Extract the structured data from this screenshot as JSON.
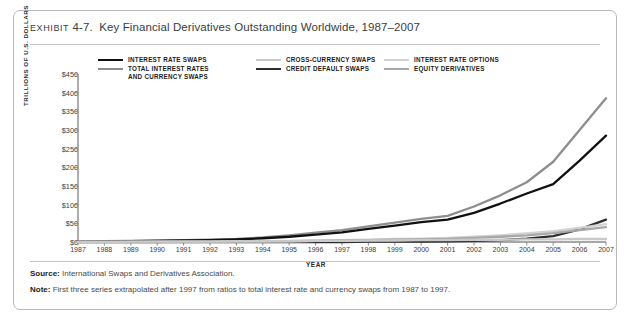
{
  "exhibit": {
    "label": "EXHIBIT",
    "number": "4-7.",
    "title": "Key Financial Derivatives Outstanding Worldwide, 1987–2007"
  },
  "notes": {
    "source_label": "Source:",
    "source_text": " International Swaps and Derivatives Association.",
    "note_label": "Note:",
    "note_text": " First three series extrapolated after 1997 from ratios to total interest rate and currency swaps from 1987 to 1997."
  },
  "legend": [
    {
      "label": "INTEREST RATE SWAPS",
      "color": "#111111",
      "width": 2.6
    },
    {
      "label": "TOTAL INTEREST RATES\nAND CURRENCY SWAPS",
      "color": "#8e8e8e",
      "width": 2.6
    },
    {
      "label": "CROSS-CURRENCY SWAPS",
      "color": "#c9c9c9",
      "width": 2.6
    },
    {
      "label": "CREDIT DEFAULT SWAPS",
      "color": "#2e2e2e",
      "width": 2.6
    },
    {
      "label": "INTEREST RATE OPTIONS",
      "color": "#d2d2d2",
      "width": 2.6
    },
    {
      "label": "EQUITY DERIVATIVES",
      "color": "#a8a8a8",
      "width": 2.6
    }
  ],
  "chart_data": {
    "type": "line",
    "title": "Key Financial Derivatives Outstanding Worldwide, 1987–2007",
    "xlabel": "YEAR",
    "ylabel": "TRILLIONS OF U.S. DOLLARS",
    "grid": false,
    "legend_position": "top",
    "ylim": [
      0,
      450
    ],
    "yticks": [
      0,
      50,
      100,
      150,
      200,
      250,
      300,
      350,
      400,
      450
    ],
    "ytick_labels": [
      "$0",
      "$50",
      "$100",
      "$150",
      "$200",
      "$250",
      "$300",
      "$350",
      "$400",
      "$450"
    ],
    "x": [
      1987,
      1988,
      1989,
      1990,
      1991,
      1992,
      1993,
      1994,
      1995,
      1996,
      1997,
      1998,
      1999,
      2000,
      2001,
      2002,
      2003,
      2004,
      2005,
      2006,
      2007
    ],
    "categories": [
      "1987",
      "1988",
      "1989",
      "1990",
      "1991",
      "1992",
      "1993",
      "1994",
      "1995",
      "1996",
      "1997",
      "1998",
      "1999",
      "2000",
      "2001",
      "2002",
      "2003",
      "2004",
      "2005",
      "2006",
      "2007"
    ],
    "series": [
      {
        "name": "TOTAL INTEREST RATES AND CURRENCY SWAPS",
        "color": "#8e8e8e",
        "values": [
          1,
          2,
          3,
          4,
          5,
          6,
          8,
          12,
          18,
          25,
          32,
          42,
          52,
          62,
          70,
          95,
          125,
          160,
          215,
          300,
          385
        ]
      },
      {
        "name": "INTEREST RATE SWAPS",
        "color": "#111111",
        "values": [
          1,
          1,
          2,
          3,
          4,
          5,
          7,
          10,
          14,
          20,
          26,
          35,
          44,
          53,
          60,
          78,
          103,
          130,
          155,
          218,
          285
        ]
      },
      {
        "name": "CREDIT DEFAULT SWAPS",
        "color": "#2e2e2e",
        "values": [
          0,
          0,
          0,
          0,
          0,
          0,
          0,
          0,
          0,
          0,
          0,
          1,
          1,
          1,
          2,
          3,
          5,
          9,
          16,
          34,
          60
        ]
      },
      {
        "name": "INTEREST RATE OPTIONS",
        "color": "#d2d2d2",
        "values": [
          0,
          0,
          0,
          1,
          1,
          1,
          2,
          2,
          3,
          4,
          5,
          6,
          8,
          9,
          11,
          14,
          18,
          23,
          29,
          38,
          48
        ]
      },
      {
        "name": "EQUITY DERIVATIVES",
        "color": "#a8a8a8",
        "values": [
          0,
          0,
          0,
          0,
          1,
          1,
          1,
          2,
          2,
          3,
          4,
          5,
          6,
          7,
          8,
          11,
          14,
          18,
          24,
          32,
          40
        ]
      },
      {
        "name": "CROSS-CURRENCY SWAPS",
        "color": "#c9c9c9",
        "values": [
          0,
          0,
          1,
          1,
          1,
          1,
          2,
          2,
          2,
          3,
          3,
          4,
          4,
          5,
          5,
          6,
          6,
          7,
          7,
          8,
          8
        ]
      }
    ]
  }
}
